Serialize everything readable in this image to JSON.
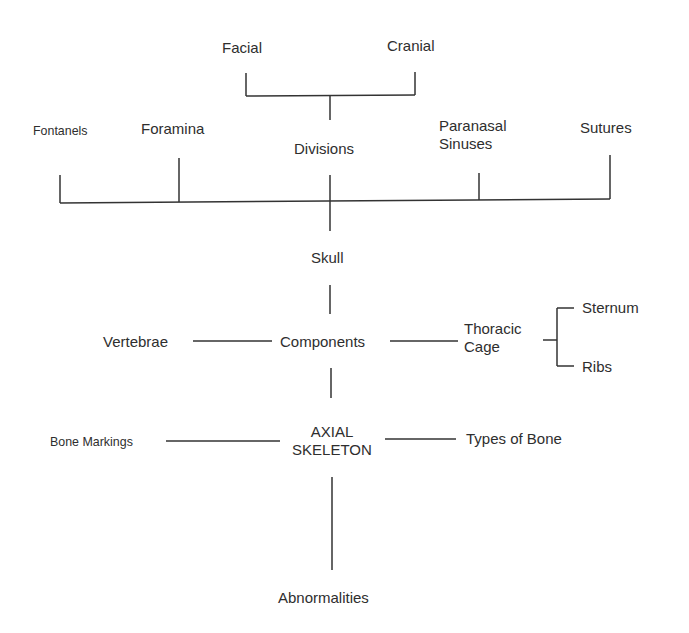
{
  "diagram": {
    "title": "AXIAL SKELETON",
    "root": {
      "line1": "AXIAL",
      "line2": "SKELETON"
    },
    "nodes": {
      "facial": "Facial",
      "cranial": "Cranial",
      "fontanels": "Fontanels",
      "foramina": "Foramina",
      "divisions": "Divisions",
      "paranasal_line1": "Paranasal",
      "paranasal_line2": "Sinuses",
      "sutures": "Sutures",
      "skull": "Skull",
      "vertebrae": "Vertebrae",
      "components": "Components",
      "thoracic_line1": "Thoracic",
      "thoracic_line2": "Cage",
      "sternum": "Sternum",
      "ribs": "Ribs",
      "bone_markings": "Bone Markings",
      "types_of_bone": "Types of Bone",
      "abnormalities": "Abnormalities"
    },
    "edges": [
      [
        "AXIAL SKELETON",
        "Components"
      ],
      [
        "AXIAL SKELETON",
        "Bone Markings"
      ],
      [
        "AXIAL SKELETON",
        "Types of Bone"
      ],
      [
        "AXIAL SKELETON",
        "Abnormalities"
      ],
      [
        "Components",
        "Skull"
      ],
      [
        "Components",
        "Vertebrae"
      ],
      [
        "Components",
        "Thoracic Cage"
      ],
      [
        "Thoracic Cage",
        "Sternum"
      ],
      [
        "Thoracic Cage",
        "Ribs"
      ],
      [
        "Skull",
        "Fontanels"
      ],
      [
        "Skull",
        "Foramina"
      ],
      [
        "Skull",
        "Divisions"
      ],
      [
        "Skull",
        "Paranasal Sinuses"
      ],
      [
        "Skull",
        "Sutures"
      ],
      [
        "Divisions",
        "Facial"
      ],
      [
        "Divisions",
        "Cranial"
      ]
    ]
  }
}
